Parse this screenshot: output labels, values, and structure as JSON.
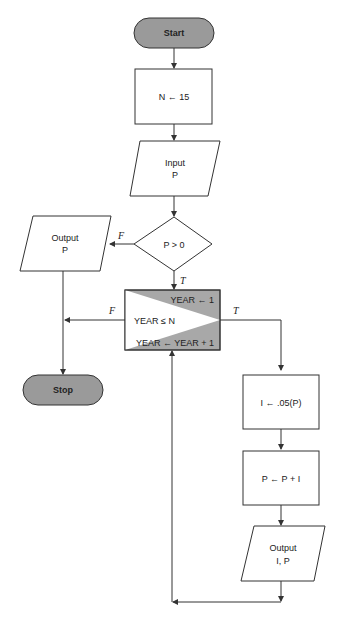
{
  "diagram": {
    "type": "flowchart",
    "colors": {
      "terminal_fill": "#9a9a9a",
      "loop_fill": "#a8a8a8",
      "line": "#333333",
      "background": "#ffffff"
    },
    "nodes": {
      "start": {
        "label": "Start",
        "shape": "terminal"
      },
      "init_n": {
        "label": "N ← 15",
        "shape": "process"
      },
      "input_p": {
        "line1": "Input",
        "line2": "P",
        "shape": "io"
      },
      "decision_p": {
        "label": "P > 0",
        "shape": "decision"
      },
      "output_p": {
        "line1": "Output",
        "line2": "P",
        "shape": "io"
      },
      "loop": {
        "init": "YEAR ← 1",
        "test": "YEAR ≤ N",
        "incr": "YEAR ← YEAR + 1",
        "shape": "loop"
      },
      "stop": {
        "label": "Stop",
        "shape": "terminal"
      },
      "calc_i": {
        "label": "I ← .05(P)",
        "shape": "process"
      },
      "calc_p": {
        "label": "P ← P + I",
        "shape": "process"
      },
      "output_ip": {
        "line1": "Output",
        "line2": "I, P",
        "shape": "io"
      }
    },
    "edge_labels": {
      "decision_false": "F",
      "decision_true": "T",
      "loop_false": "F",
      "loop_true": "T"
    }
  }
}
